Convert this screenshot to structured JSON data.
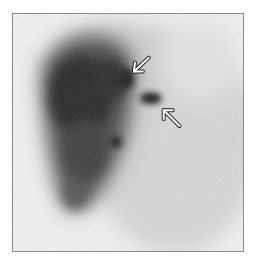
{
  "image": {
    "description": "Grayscale nuclear medicine scintigraphy scan with two white arrows indicating focal areas of increased uptake",
    "frame_color": "#8a8a8a",
    "background_color": "#f4f4f4",
    "activity_colors": {
      "dense": "#1e1e1e",
      "medium": "#5a5a5a",
      "faint": "#cfcfcf"
    }
  },
  "annotations": [
    {
      "type": "arrow",
      "icon": "arrow-down-left-icon",
      "color": "#ffffff",
      "tip": [
        133,
        72
      ],
      "tail": [
        149,
        57
      ]
    },
    {
      "type": "arrow",
      "icon": "arrow-up-left-icon",
      "color": "#ffffff",
      "tip": [
        163,
        109
      ],
      "tail": [
        180,
        126
      ]
    }
  ]
}
